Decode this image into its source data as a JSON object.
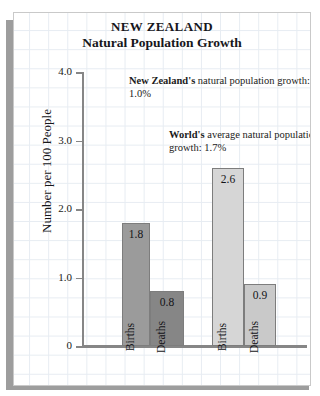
{
  "chart_data": {
    "type": "bar",
    "title": "NEW ZEALAND",
    "subtitle": "Natural Population Growth",
    "xlabel": "",
    "ylabel": "Number per 100 People",
    "ylim": [
      0,
      4.0
    ],
    "yticks": [
      "0",
      "1.0",
      "2.0",
      "3.0",
      "4.0"
    ],
    "ytick_values": [
      0,
      1.0,
      2.0,
      3.0,
      4.0
    ],
    "grid": true,
    "legend": "none",
    "groups": [
      {
        "name": "New Zealand",
        "bars": [
          {
            "label": "Births",
            "value": 1.8,
            "value_label": "1.8",
            "color": "#9b9b9b"
          },
          {
            "label": "Deaths",
            "value": 0.8,
            "value_label": "0.8",
            "color": "#868686"
          }
        ]
      },
      {
        "name": "World",
        "bars": [
          {
            "label": "Births",
            "value": 2.6,
            "value_label": "2.6",
            "color": "#d6d6d6"
          },
          {
            "label": "Deaths",
            "value": 0.9,
            "value_label": "0.9",
            "color": "#c9c9c9"
          }
        ]
      }
    ],
    "categories": [
      "NZ Births",
      "NZ Deaths",
      "World Births",
      "World Deaths"
    ],
    "values": [
      1.8,
      0.8,
      2.6,
      0.9
    ],
    "annotations": [
      {
        "id": "nz-growth",
        "bold_text": "New Zealand's",
        "rest_text": " natural population growth:  1.0%",
        "value": 1.0
      },
      {
        "id": "world-growth",
        "bold_text": "World's",
        "rest_text": " average natural population growth:  1.7%",
        "value": 1.7
      }
    ]
  },
  "axis": {
    "ylabel": "Number per 100 People"
  }
}
